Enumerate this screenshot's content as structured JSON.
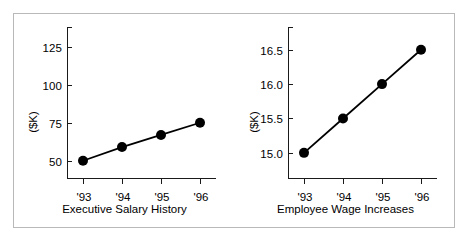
{
  "figure": {
    "border_color": "#b9b9b9",
    "background": "#ffffff",
    "ink_color": "#1a1a1a"
  },
  "chart_data": [
    {
      "type": "line",
      "title": "",
      "xlabel": "Executive Salary History",
      "ylabel": "($K)",
      "categories": [
        "'93",
        "'94",
        "'95",
        "'96"
      ],
      "values": [
        50,
        59,
        67,
        75
      ],
      "yticks": [
        50,
        75,
        100,
        125
      ],
      "yticklabels": [
        "50",
        "75",
        "100",
        "125"
      ],
      "ylim": [
        38,
        138
      ],
      "grid": false,
      "legend": false,
      "marker": "filled-circle",
      "line_color": "#000000",
      "marker_color": "#000000"
    },
    {
      "type": "line",
      "title": "",
      "xlabel": "Employee Wage Increases",
      "ylabel": "($K)",
      "categories": [
        "'93",
        "'94",
        "'95",
        "'96"
      ],
      "values": [
        15.0,
        15.5,
        16.0,
        16.5
      ],
      "yticks": [
        15.0,
        15.5,
        16.0,
        16.5
      ],
      "yticklabels": [
        "15.0",
        "15.5",
        "16.0",
        "16.5"
      ],
      "ylim": [
        14.62,
        16.83
      ],
      "grid": false,
      "legend": false,
      "marker": "filled-circle",
      "line_color": "#000000",
      "marker_color": "#000000"
    }
  ]
}
